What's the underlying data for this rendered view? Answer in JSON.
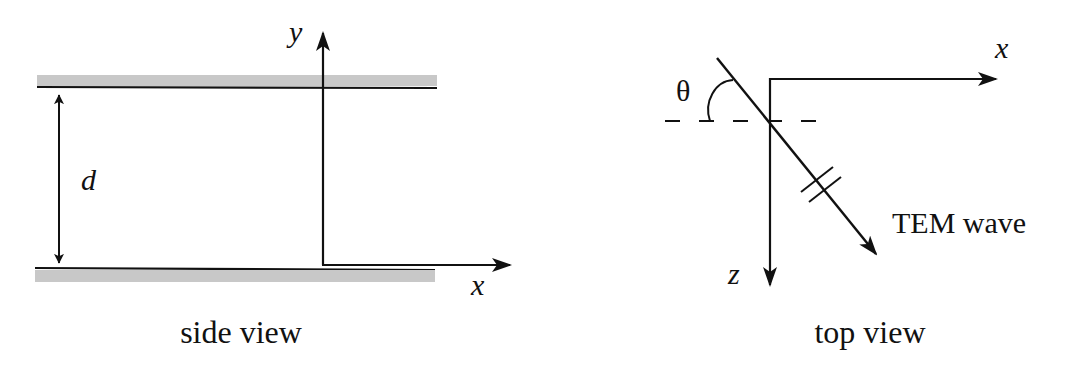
{
  "diagram": {
    "colors": {
      "line": "#111111",
      "plate": "#c8c8c8",
      "background": "#ffffff"
    },
    "side_view": {
      "caption": "side view",
      "separation_label": "d",
      "axis_y_label": "y",
      "axis_x_label": "x",
      "plates": [
        "top conducting plate",
        "bottom conducting plate"
      ]
    },
    "top_view": {
      "caption": "top view",
      "angle_label": "θ",
      "axis_x_label": "x",
      "axis_z_label": "z",
      "wave_label": "TEM wave"
    }
  }
}
